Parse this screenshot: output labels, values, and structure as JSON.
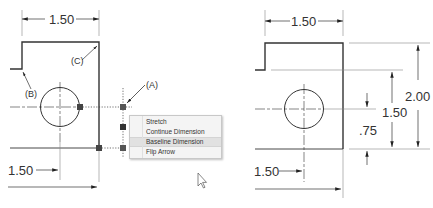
{
  "left_drawing": {
    "top_dimension": "1.50",
    "bottom_dimension": "1.50",
    "callouts": [
      "(A)",
      "(B)",
      "(C)"
    ],
    "context_menu": {
      "items": [
        {
          "label": "Stretch"
        },
        {
          "label": "Continue Dimension"
        },
        {
          "label": "Baseline Dimension",
          "highlighted": true
        },
        {
          "label": "Flip Arrow"
        }
      ]
    }
  },
  "right_drawing": {
    "top_dimension": "1.50",
    "bottom_dimension": "1.50",
    "vertical_dimensions": {
      "overall": "2.00",
      "middle": "1.50",
      "hole_center": ".75"
    }
  },
  "colors": {
    "line": "#333333",
    "grip": "#555555",
    "menu_bg": "#f4f4f4",
    "menu_highlight": "#e1e1e1"
  }
}
